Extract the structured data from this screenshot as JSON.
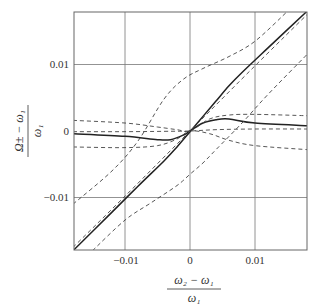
{
  "chart_data": {
    "type": "line",
    "title": "",
    "xlabel": "(ω2 − ω1) / ω1",
    "ylabel": "(Ω± − ω1) / ω1",
    "xlim": [
      -0.018,
      0.018
    ],
    "ylim": [
      -0.018,
      0.018
    ],
    "grid": true,
    "xticks": [
      -0.01,
      0,
      0.01
    ],
    "yticks": [
      -0.01,
      0,
      0.01
    ],
    "xtick_labels": [
      "−0.01",
      "0",
      "0.01"
    ],
    "ytick_labels": [
      "−0.01",
      "0",
      "0.01"
    ],
    "series": [
      {
        "name": "solid-rising",
        "style": "solid",
        "x": [
          -0.018,
          -0.012,
          -0.008,
          -0.004,
          -0.002,
          0,
          0.002,
          0.004,
          0.006,
          0.008,
          0.012,
          0.018
        ],
        "y": [
          -0.018,
          -0.0122,
          -0.0083,
          -0.0045,
          -0.0024,
          -0.0001,
          0.0022,
          0.0045,
          0.0068,
          0.0088,
          0.0125,
          0.018
        ]
      },
      {
        "name": "solid-flat",
        "style": "solid",
        "x": [
          -0.018,
          -0.01,
          -0.005,
          -0.003,
          -0.001,
          0,
          0.002,
          0.004,
          0.006,
          0.01,
          0.018
        ],
        "y": [
          -0.0004,
          -0.0008,
          -0.0013,
          -0.0013,
          -0.0006,
          0,
          0.0012,
          0.0017,
          0.0018,
          0.0012,
          0.0008
        ]
      },
      {
        "name": "dashed-upper-diag",
        "style": "dashed",
        "x": [
          -0.018,
          -0.012,
          -0.008,
          -0.004,
          -0.001,
          0.002,
          0.006,
          0.01,
          0.015
        ],
        "y": [
          -0.011,
          -0.006,
          -0.0015,
          0.0048,
          0.0078,
          0.0094,
          0.0112,
          0.0135,
          0.018
        ]
      },
      {
        "name": "dashed-lower-diag",
        "style": "dashed",
        "x": [
          -0.015,
          -0.01,
          -0.006,
          -0.002,
          0,
          0.002,
          0.004,
          0.008,
          0.012,
          0.018
        ],
        "y": [
          -0.018,
          -0.0134,
          -0.0108,
          -0.0082,
          -0.0065,
          -0.0048,
          -0.0028,
          0.0012,
          0.0055,
          0.0115
        ]
      },
      {
        "name": "dashed-flat-upper",
        "style": "dashed",
        "x": [
          -0.018,
          -0.01,
          -0.005,
          -0.002,
          0,
          0.003,
          0.006,
          0.01,
          0.018
        ],
        "y": [
          0.0016,
          0.0012,
          0.0006,
          0.0002,
          0,
          0.0018,
          0.0024,
          0.0025,
          0.0023
        ]
      },
      {
        "name": "dashed-flat-lower",
        "style": "dashed",
        "x": [
          -0.018,
          -0.01,
          -0.005,
          -0.002,
          0,
          0.003,
          0.006,
          0.01,
          0.018
        ],
        "y": [
          -0.0024,
          -0.0025,
          -0.0022,
          -0.0012,
          0,
          -0.0004,
          -0.0014,
          -0.0022,
          -0.0028
        ]
      },
      {
        "name": "dashed-flat-mid",
        "style": "dashed",
        "x": [
          -0.018,
          -0.01,
          -0.004,
          0,
          0.004,
          0.01,
          0.018
        ],
        "y": [
          -0.0001,
          -0.0001,
          -5e-05,
          0,
          0.0002,
          0.0003,
          0.0003
        ]
      },
      {
        "name": "dashed-center-diag",
        "style": "dashed",
        "x": [
          -0.018,
          -0.01,
          0,
          0.01,
          0.018
        ],
        "y": [
          -0.0175,
          -0.0098,
          0,
          0.0098,
          0.0175
        ]
      }
    ]
  },
  "axes": {
    "x_tick_labels": [
      "−0.01",
      "0",
      "0.01"
    ],
    "y_tick_labels": [
      "0.01",
      "0",
      "−0.01"
    ],
    "x_label_num": "ω₂ − ω₁",
    "x_label_den": "ω₁",
    "y_label_num": "Ω± − ω₁",
    "y_label_den": "ω₁"
  }
}
